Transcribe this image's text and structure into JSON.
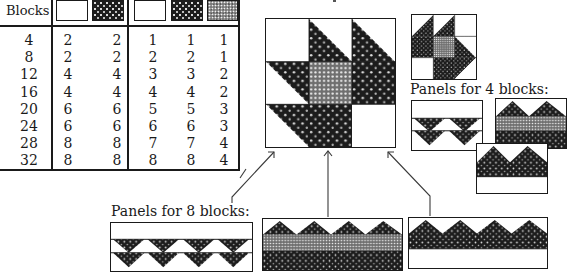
{
  "table": {
    "header_label": "Blocks",
    "swatches": [
      {
        "group": 1,
        "fabric": "white"
      },
      {
        "group": 1,
        "fabric": "dark-print"
      },
      {
        "group": 2,
        "fabric": "white"
      },
      {
        "group": 2,
        "fabric": "dark-print"
      },
      {
        "group": 2,
        "fabric": "medium-print"
      }
    ],
    "columns": {
      "blocks": [
        "4",
        "8",
        "12",
        "16",
        "20",
        "24",
        "28",
        "32"
      ],
      "g1_white": [
        "2",
        "2",
        "4",
        "4",
        "6",
        "6",
        "8",
        "8"
      ],
      "g1_dark": [
        "2",
        "2",
        "4",
        "4",
        "6",
        "6",
        "8",
        "8"
      ],
      "g2_white": [
        "1",
        "2",
        "3",
        "4",
        "5",
        "6",
        "7",
        "8"
      ],
      "g2_dark": [
        "1",
        "2",
        "3",
        "4",
        "5",
        "6",
        "7",
        "8"
      ],
      "g2_medium": [
        "1",
        "1",
        "2",
        "2",
        "3",
        "3",
        "4",
        "4"
      ]
    }
  },
  "main_block": {
    "name": "large-quilt-block"
  },
  "small_block": {
    "name": "small-quilt-block"
  },
  "captions": {
    "panels_4": "Panels for 4 blocks:",
    "panels_8": "Panels for 8 blocks:"
  },
  "colors": {
    "ink": "#1a1a1a",
    "dark_fabric": "#1c1c1c",
    "medium_fabric": "#7a7a7a",
    "white_fabric": "#ffffff"
  }
}
